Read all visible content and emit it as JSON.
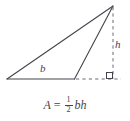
{
  "figure": {
    "type": "geometry-diagram",
    "width": 130,
    "height": 121,
    "background_color": "#ffffff",
    "stroke_color": "#44444c",
    "labels": {
      "base": "b",
      "height": "h"
    },
    "formula": {
      "left_side": "A",
      "equals": "=",
      "fraction_numerator": "1",
      "fraction_denominator": "2",
      "right_side": "bh",
      "plain_text": "A = 1/2 bh"
    },
    "markers": {
      "right_angle": "right-angle-square"
    },
    "geometry": {
      "apex": [
        113,
        6
      ],
      "left_vertex": [
        7,
        79
      ],
      "base_right_vertex": [
        74,
        79
      ],
      "foot_of_altitude": [
        113,
        79
      ],
      "solid_edges": [
        [
          [
            7,
            79
          ],
          [
            113,
            6
          ]
        ],
        [
          [
            7,
            79
          ],
          [
            74,
            79
          ]
        ],
        [
          [
            74,
            79
          ],
          [
            113,
            6
          ]
        ]
      ],
      "dashed_segments": [
        [
          [
            113,
            6
          ],
          [
            113,
            79
          ]
        ],
        [
          [
            75,
            79
          ],
          [
            120,
            79
          ]
        ]
      ]
    }
  }
}
